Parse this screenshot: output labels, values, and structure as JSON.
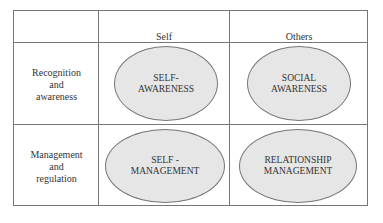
{
  "columns": {
    "self": "Self",
    "others": "Others"
  },
  "rows": {
    "recognition": "Recognition\nand\nawareness",
    "management": "Management\nand\nregulation"
  },
  "cells": {
    "self_awareness": "SELF-\nAWARENESS",
    "social_awareness": "SOCIAL\nAWARENESS",
    "self_management": "SELF -\nMANAGEMENT",
    "relationship_management": "RELATIONSHIP\nMANAGEMENT"
  },
  "colors": {
    "ellipse_fill": "#e6e6e6",
    "line": "#777777"
  }
}
